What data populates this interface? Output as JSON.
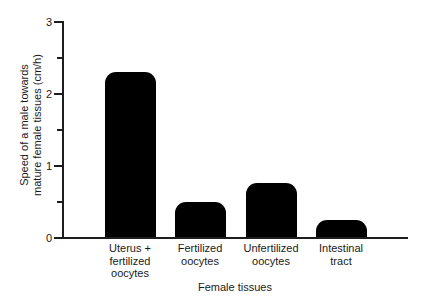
{
  "chart_data": {
    "type": "bar",
    "title": "",
    "xlabel": "Female tissues",
    "ylabel": "Speed of a male towards mature female tissues (cm/h)",
    "ylabel_lines": [
      "Speed of a male towards",
      "mature female tissues (cm/h)"
    ],
    "categories": [
      "Uterus + fertilized oocytes",
      "Fertilized oocytes",
      "Unfertilized oocytes",
      "Intestinal tract"
    ],
    "category_lines": [
      [
        "Uterus +",
        "fertilized",
        "oocytes"
      ],
      [
        "Fertilized",
        "oocytes"
      ],
      [
        "Unfertilized",
        "oocytes"
      ],
      [
        "Intestinal",
        "tract"
      ]
    ],
    "values": [
      2.31,
      0.5,
      0.76,
      0.25
    ],
    "ylim": [
      0,
      3
    ],
    "ytick_labels": [
      "0",
      "1",
      "2",
      "3"
    ],
    "ytick_values": [
      0,
      1,
      2,
      3
    ],
    "yminor_tick_values": [
      0.5,
      1.5,
      2.5
    ],
    "grid": false,
    "legend": false,
    "bar_color": "#000000",
    "axis_color": "#1d1d1d",
    "background_color": "#ffffff"
  }
}
